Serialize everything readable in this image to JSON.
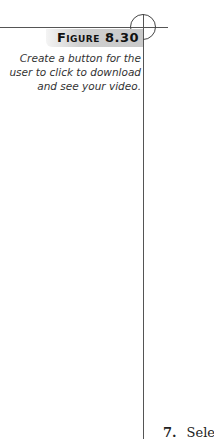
{
  "figure": {
    "label": "Figure 8.30",
    "caption": "Create a button for the user to click to download and see your video."
  },
  "body": {
    "step_number": "7.",
    "step_text": "Selec"
  },
  "colors": {
    "rule": "#555555",
    "band": "#cccccc",
    "caption_text": "#333333"
  }
}
